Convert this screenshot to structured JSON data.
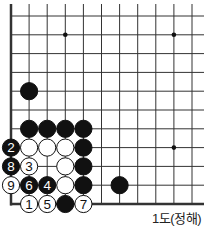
{
  "board": {
    "cols": 11,
    "rows": 11,
    "origin_x": 11,
    "origin_y": 16,
    "step_x": 18.1,
    "step_y": 18.8,
    "edges": {
      "left": true,
      "bottom": true,
      "top": false,
      "right": false
    },
    "line_color": "#333333",
    "star_points": [
      [
        3,
        1
      ],
      [
        9,
        1
      ],
      [
        9,
        7
      ]
    ],
    "stones": [
      {
        "c": 1,
        "r": 4,
        "color": "black",
        "label": ""
      },
      {
        "c": 1,
        "r": 6,
        "color": "black",
        "label": ""
      },
      {
        "c": 2,
        "r": 6,
        "color": "black",
        "label": ""
      },
      {
        "c": 3,
        "r": 6,
        "color": "black",
        "label": ""
      },
      {
        "c": 4,
        "r": 6,
        "color": "black",
        "label": ""
      },
      {
        "c": 0,
        "r": 7,
        "color": "black",
        "label": "2"
      },
      {
        "c": 1,
        "r": 7,
        "color": "white",
        "label": ""
      },
      {
        "c": 2,
        "r": 7,
        "color": "white",
        "label": ""
      },
      {
        "c": 3,
        "r": 7,
        "color": "white",
        "label": ""
      },
      {
        "c": 4,
        "r": 7,
        "color": "black",
        "label": ""
      },
      {
        "c": 0,
        "r": 8,
        "color": "black",
        "label": "8"
      },
      {
        "c": 1,
        "r": 8,
        "color": "white",
        "label": "3"
      },
      {
        "c": 3,
        "r": 8,
        "color": "white",
        "label": ""
      },
      {
        "c": 4,
        "r": 8,
        "color": "black",
        "label": ""
      },
      {
        "c": 0,
        "r": 9,
        "color": "white",
        "label": "9"
      },
      {
        "c": 1,
        "r": 9,
        "color": "black",
        "label": "6"
      },
      {
        "c": 2,
        "r": 9,
        "color": "black",
        "label": "4"
      },
      {
        "c": 3,
        "r": 9,
        "color": "white",
        "label": ""
      },
      {
        "c": 4,
        "r": 9,
        "color": "black",
        "label": ""
      },
      {
        "c": 6,
        "r": 9,
        "color": "black",
        "label": ""
      },
      {
        "c": 1,
        "r": 10,
        "color": "white",
        "label": "1"
      },
      {
        "c": 2,
        "r": 10,
        "color": "white",
        "label": "5"
      },
      {
        "c": 3,
        "r": 10,
        "color": "black",
        "label": ""
      },
      {
        "c": 4,
        "r": 10,
        "color": "white",
        "label": "7"
      }
    ]
  },
  "caption": "1도(정해)"
}
